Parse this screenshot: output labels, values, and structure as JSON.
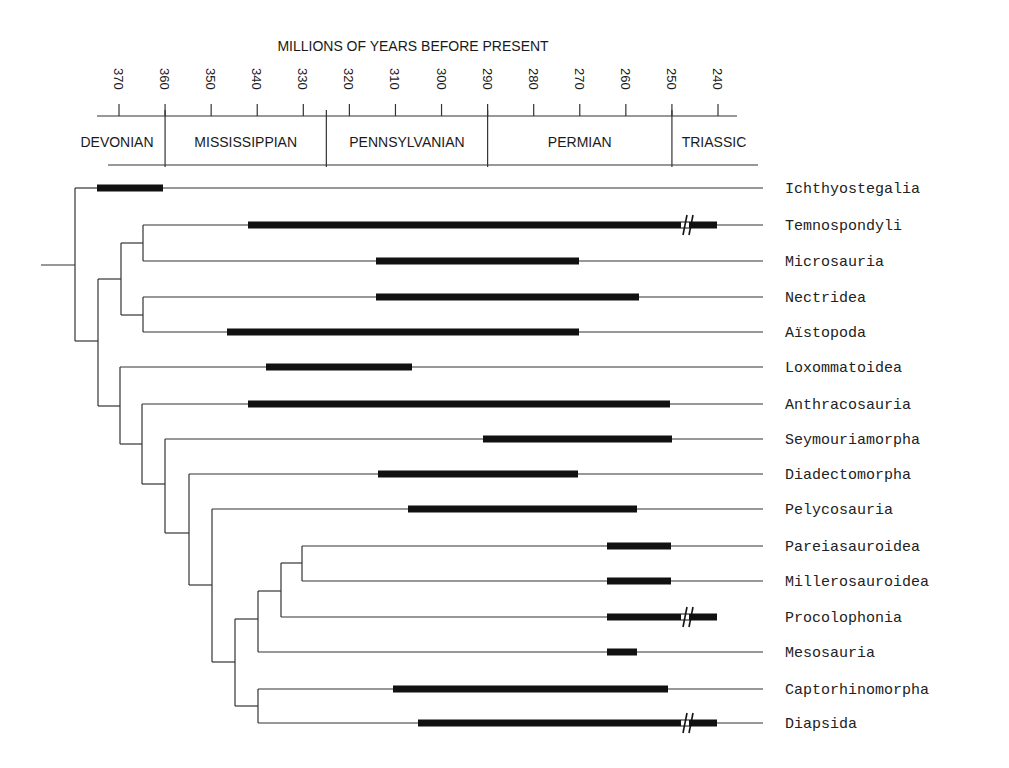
{
  "header": {
    "axis_title": "MILLIONS OF YEARS BEFORE PRESENT",
    "ticks": [
      370,
      360,
      350,
      340,
      330,
      320,
      310,
      300,
      290,
      280,
      270,
      260,
      250,
      240
    ],
    "periods": [
      {
        "name": "DEVONIAN",
        "start": 375,
        "end": 360
      },
      {
        "name": "MISSISSIPPIAN",
        "start": 360,
        "end": 325
      },
      {
        "name": "PENNSYLVANIAN",
        "start": 325,
        "end": 290
      },
      {
        "name": "PERMIAN",
        "start": 290,
        "end": 250
      },
      {
        "name": "TRIASSIC",
        "start": 250,
        "end": 236
      }
    ]
  },
  "colors": {
    "line": "#333333",
    "bar": "#111111",
    "text": "#1a1a1a"
  },
  "chart_data": {
    "type": "phylogenetic-tree-with-range-bars",
    "title": "MILLIONS OF YEARS BEFORE PRESENT",
    "xlabel": "Millions of years before present",
    "x_ticks": [
      370,
      360,
      350,
      340,
      330,
      320,
      310,
      300,
      290,
      280,
      270,
      260,
      250,
      240
    ],
    "periods": [
      "DEVONIAN",
      "MISSISSIPPIAN",
      "PENNSYLVANIAN",
      "PERMIAN",
      "TRIASSIC"
    ],
    "taxa": [
      {
        "name": "Ichthyostegalia",
        "range_ma": [
          367,
          360
        ],
        "break": false
      },
      {
        "name": "Temnospondyli",
        "range_ma": [
          347,
          240
        ],
        "break": true
      },
      {
        "name": "Microsauria",
        "range_ma": [
          319,
          270
        ],
        "break": false
      },
      {
        "name": "Nectridea",
        "range_ma": [
          319,
          257
        ],
        "break": false
      },
      {
        "name": "Aïstopoda",
        "range_ma": [
          341,
          270
        ],
        "break": false
      },
      {
        "name": "Loxommatoidea",
        "range_ma": [
          336,
          303
        ],
        "break": false
      },
      {
        "name": "Anthracosauria",
        "range_ma": [
          340,
          250
        ],
        "break": false
      },
      {
        "name": "Seymouriamorpha",
        "range_ma": [
          293,
          250
        ],
        "break": false
      },
      {
        "name": "Diadectomorpha",
        "range_ma": [
          318,
          270
        ],
        "break": false
      },
      {
        "name": "Pelycosauria",
        "range_ma": [
          305,
          258
        ],
        "break": false
      },
      {
        "name": "Pareiasauroidea",
        "range_ma": [
          264,
          250
        ],
        "break": false
      },
      {
        "name": "Millerosauroidea",
        "range_ma": [
          264,
          250
        ],
        "break": false
      },
      {
        "name": "Procolophonia",
        "range_ma": [
          264,
          240
        ],
        "break": true
      },
      {
        "name": "Mesosauria",
        "range_ma": [
          264,
          257
        ],
        "break": false
      },
      {
        "name": "Captorhinomorpha",
        "range_ma": [
          316,
          251
        ],
        "break": false
      },
      {
        "name": "Diapsida",
        "range_ma": [
          311,
          240
        ],
        "break": true
      }
    ]
  },
  "taxa": [
    {
      "name": "Ichthyostegalia",
      "y": 188,
      "bar": [
        97,
        163
      ],
      "line_end": 763,
      "brk": null
    },
    {
      "name": "Temnospondyli",
      "y": 225,
      "bar": [
        248,
        717
      ],
      "line_end": 763,
      "brk": 682
    },
    {
      "name": "Microsauria",
      "y": 261,
      "bar": [
        376,
        579
      ],
      "line_end": 763,
      "brk": null
    },
    {
      "name": "Nectridea",
      "y": 297,
      "bar": [
        376,
        639
      ],
      "line_end": 763,
      "brk": null
    },
    {
      "name": "Aïstopoda",
      "y": 332,
      "bar": [
        227,
        579
      ],
      "line_end": 763,
      "brk": null
    },
    {
      "name": "Loxommatoidea",
      "y": 367,
      "bar": [
        266,
        412
      ],
      "line_end": 763,
      "brk": null
    },
    {
      "name": "Anthracosauria",
      "y": 404,
      "bar": [
        248,
        670
      ],
      "line_end": 763,
      "brk": null
    },
    {
      "name": "Seymouriamorpha",
      "y": 439,
      "bar": [
        483,
        672
      ],
      "line_end": 763,
      "brk": null
    },
    {
      "name": "Diadectomorpha",
      "y": 474,
      "bar": [
        378,
        578
      ],
      "line_end": 763,
      "brk": null
    },
    {
      "name": "Pelycosauria",
      "y": 509,
      "bar": [
        408,
        637
      ],
      "line_end": 763,
      "brk": null
    },
    {
      "name": "Pareiasauroidea",
      "y": 546,
      "bar": [
        607,
        671
      ],
      "line_end": 763,
      "brk": null
    },
    {
      "name": "Millerosauroidea",
      "y": 581,
      "bar": [
        607,
        671
      ],
      "line_end": 763,
      "brk": null
    },
    {
      "name": "Procolophonia",
      "y": 617,
      "bar": [
        607,
        717
      ],
      "line_end": 717,
      "brk": 682
    },
    {
      "name": "Mesosauria",
      "y": 652,
      "bar": [
        607,
        637
      ],
      "line_end": 763,
      "brk": null
    },
    {
      "name": "Captorhinomorpha",
      "y": 689,
      "bar": [
        393,
        668
      ],
      "line_end": 763,
      "brk": null
    },
    {
      "name": "Diapsida",
      "y": 723,
      "bar": [
        418,
        717
      ],
      "line_end": 763,
      "brk": 682
    }
  ],
  "tree": {
    "root_stem": {
      "x1": 41,
      "x2": 75,
      "y": 265
    },
    "nodes": [
      {
        "x": 75,
        "y_top": 188,
        "y_bot": 341,
        "children": [
          {
            "y": 188,
            "to": 97
          },
          {
            "y": 341,
            "to": 98
          }
        ]
      },
      {
        "x": 98,
        "y_top": 279,
        "y_bot": 406,
        "children": [
          {
            "y": 279,
            "to": 121
          },
          {
            "y": 406,
            "to": 120
          }
        ]
      },
      {
        "x": 121,
        "y_top": 243,
        "y_bot": 315,
        "children": [
          {
            "y": 243,
            "to": 143
          },
          {
            "y": 315,
            "to": 143
          }
        ]
      },
      {
        "x": 143,
        "y_top": 225,
        "y_bot": 261,
        "children": [
          {
            "y": 225,
            "to": 248
          },
          {
            "y": 261,
            "to": 376
          }
        ]
      },
      {
        "x": 143,
        "y_top": 297,
        "y_bot": 332,
        "children": [
          {
            "y": 297,
            "to": 376
          },
          {
            "y": 332,
            "to": 227
          }
        ]
      },
      {
        "x": 120,
        "y_top": 367,
        "y_bot": 444,
        "children": [
          {
            "y": 367,
            "to": 266
          },
          {
            "y": 444,
            "to": 142
          }
        ]
      },
      {
        "x": 142,
        "y_top": 404,
        "y_bot": 484,
        "children": [
          {
            "y": 404,
            "to": 248
          },
          {
            "y": 484,
            "to": 165
          }
        ]
      },
      {
        "x": 165,
        "y_top": 439,
        "y_bot": 533,
        "children": [
          {
            "y": 439,
            "to": 483
          },
          {
            "y": 533,
            "to": 189
          }
        ]
      },
      {
        "x": 189,
        "y_top": 474,
        "y_bot": 585,
        "children": [
          {
            "y": 474,
            "to": 378
          },
          {
            "y": 585,
            "to": 212
          }
        ]
      },
      {
        "x": 212,
        "y_top": 509,
        "y_bot": 662,
        "children": [
          {
            "y": 509,
            "to": 408
          },
          {
            "y": 662,
            "to": 235
          }
        ]
      },
      {
        "x": 235,
        "y_top": 619,
        "y_bot": 706,
        "children": [
          {
            "y": 619,
            "to": 258
          },
          {
            "y": 706,
            "to": 258
          }
        ]
      },
      {
        "x": 258,
        "y_top": 591,
        "y_bot": 652,
        "children": [
          {
            "y": 591,
            "to": 281
          },
          {
            "y": 652,
            "to": 607
          }
        ]
      },
      {
        "x": 281,
        "y_top": 563,
        "y_bot": 617,
        "children": [
          {
            "y": 563,
            "to": 302
          },
          {
            "y": 617,
            "to": 607
          }
        ]
      },
      {
        "x": 302,
        "y_top": 546,
        "y_bot": 581,
        "children": [
          {
            "y": 546,
            "to": 607
          },
          {
            "y": 581,
            "to": 607
          }
        ]
      },
      {
        "x": 258,
        "y_top": 689,
        "y_bot": 723,
        "children": [
          {
            "y": 689,
            "to": 393
          },
          {
            "y": 723,
            "to": 418
          }
        ]
      }
    ]
  }
}
